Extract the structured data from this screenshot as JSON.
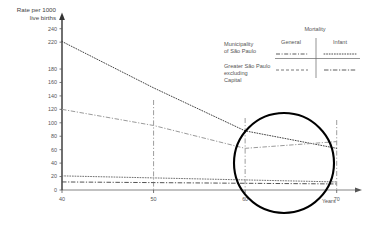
{
  "chart_data": {
    "type": "line",
    "title": "",
    "ylabel_line1": "Rate per 1000",
    "ylabel_line2": "live births",
    "xlabel": "Years",
    "xlim": [
      40,
      72
    ],
    "ylim": [
      0,
      250
    ],
    "grid": false,
    "xticks": [
      "40",
      "50",
      "60",
      "70"
    ],
    "xtick_values": [
      40,
      50,
      60,
      70
    ],
    "yticks": [
      "240",
      "220",
      "180",
      "160",
      "140",
      "120",
      "100",
      "80",
      "60",
      "40",
      "20",
      "0"
    ],
    "ytick_values": [
      240,
      220,
      180,
      160,
      140,
      120,
      100,
      80,
      60,
      40,
      20,
      0
    ],
    "legend_position": "upper-right",
    "legend_title": "Mortality",
    "legend_columns": [
      "General",
      "Infant"
    ],
    "legend_rows": [
      "Municipality of São Paulo",
      "Greater São Paulo excluding Capital"
    ],
    "annotation_circle": "magnifier highlighting years 60 to 70",
    "guide_lines_x": [
      50,
      60,
      70
    ],
    "series": [
      {
        "name": "Municipality of São Paulo — Infant",
        "row": "Municipality of São Paulo",
        "column": "Infant",
        "style": "dotted",
        "color": "#3a3a3a",
        "x": [
          40,
          50,
          60,
          70
        ],
        "values": [
          221,
          152,
          88,
          62
        ]
      },
      {
        "name": "Greater São Paulo excluding Capital — Infant",
        "row": "Greater São Paulo excluding Capital",
        "column": "Infant",
        "style": "dash-dot",
        "color": "#9a9a9a",
        "x": [
          40,
          50,
          60,
          70
        ],
        "values": [
          120,
          96,
          62,
          72
        ]
      },
      {
        "name": "Municipality of São Paulo — General",
        "row": "Municipality of São Paulo",
        "column": "General",
        "style": "dotted",
        "color": "#6a6a6a",
        "x": [
          40,
          50,
          60,
          70
        ],
        "values": [
          21,
          18,
          15,
          12
        ]
      },
      {
        "name": "Greater São Paulo excluding Capital — General",
        "row": "Greater São Paulo excluding Capital",
        "column": "General",
        "style": "dash-dot",
        "color": "#4a4a4a",
        "x": [
          40,
          50,
          60,
          70
        ],
        "values": [
          12,
          11,
          10,
          9
        ]
      }
    ]
  }
}
